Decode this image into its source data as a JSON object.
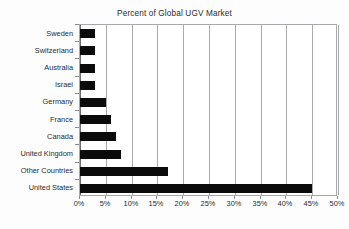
{
  "chart_data": {
    "type": "bar",
    "orientation": "horizontal",
    "title": "Percent of Global UGV Market",
    "xlabel": "",
    "ylabel": "",
    "categories": [
      "Sweden",
      "Switzerland",
      "Australia",
      "Israel",
      "Germany",
      "France",
      "Canada",
      "United Kingdom",
      "Other Countries",
      "United States"
    ],
    "values": [
      3,
      3,
      3,
      3,
      5,
      6,
      7,
      8,
      17,
      45
    ],
    "value_unit": "%",
    "xlim": [
      0,
      50
    ],
    "xticks": [
      0,
      5,
      10,
      15,
      20,
      25,
      30,
      35,
      40,
      45,
      50
    ],
    "xtick_labels": [
      "0%",
      "5%",
      "10%",
      "15%",
      "20%",
      "25%",
      "30%",
      "35%",
      "40%",
      "45%",
      "50%"
    ],
    "grid": "vertical",
    "legend": "none",
    "bar_color": "#0b0b0b",
    "grid_color": "#a9a9ae",
    "axis_color": "#6e6e73",
    "text_color": "#2b2b2b",
    "background_color": "#ffffff"
  }
}
